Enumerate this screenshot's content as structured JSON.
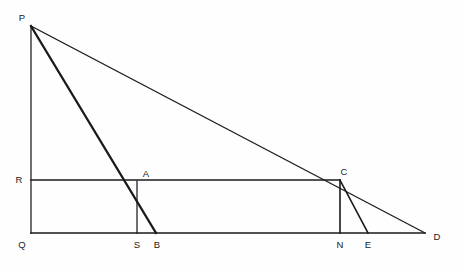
{
  "figure": {
    "background_color": "#fefefe",
    "stroke_color": "#1a1a1a",
    "width": 462,
    "height": 269
  },
  "points": [
    {
      "id": "P",
      "label": "P",
      "x": 31,
      "y": 26,
      "label_x": 22,
      "label_y": 18
    },
    {
      "id": "Q",
      "label": "Q",
      "x": 31,
      "y": 233,
      "label_x": 22,
      "label_y": 245
    },
    {
      "id": "R",
      "label": "R",
      "x": 31,
      "y": 180,
      "label_x": 19,
      "label_y": 180
    },
    {
      "id": "A",
      "label": "A",
      "x": 137,
      "y": 181,
      "label_x": 146,
      "label_y": 174
    },
    {
      "id": "S",
      "label": "S",
      "x": 137,
      "y": 233,
      "label_x": 137,
      "label_y": 245
    },
    {
      "id": "B",
      "label": "B",
      "x": 156,
      "y": 233,
      "label_x": 157,
      "label_y": 245
    },
    {
      "id": "C",
      "label": "C",
      "x": 340,
      "y": 180,
      "label_x": 344,
      "label_y": 172
    },
    {
      "id": "N",
      "label": "N",
      "x": 340,
      "y": 233,
      "label_x": 340,
      "label_y": 245
    },
    {
      "id": "E",
      "label": "E",
      "x": 368,
      "y": 233,
      "label_x": 368,
      "label_y": 245
    },
    {
      "id": "D",
      "label": "D",
      "x": 425,
      "y": 233,
      "label_x": 437,
      "label_y": 237
    }
  ],
  "segments": [
    {
      "id": "PQ",
      "name": "segment-pq",
      "from": "P",
      "to": "Q",
      "weight": "thin"
    },
    {
      "id": "QD",
      "name": "segment-qd",
      "from": "Q",
      "to": "D",
      "weight": "med"
    },
    {
      "id": "PD",
      "name": "segment-pd",
      "from": "P",
      "to": "D",
      "weight": "thin"
    },
    {
      "id": "PB",
      "name": "segment-pb",
      "from": "P",
      "to": "B",
      "weight": "thick"
    },
    {
      "id": "RC",
      "name": "segment-rc",
      "from": "R",
      "to": "C",
      "weight": "med"
    },
    {
      "id": "AS",
      "name": "segment-as",
      "from": "A",
      "to": "S",
      "weight": "thin"
    },
    {
      "id": "CN",
      "name": "segment-cn",
      "from": "C",
      "to": "N",
      "weight": "med"
    },
    {
      "id": "CE",
      "name": "segment-ce",
      "from": "C",
      "to": "E",
      "weight": "med"
    }
  ]
}
